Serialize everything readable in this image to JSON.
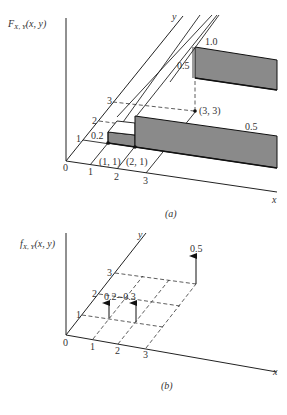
{
  "figure_a": {
    "caption": "(a)",
    "z_label": "F",
    "z_label_sub": "X, Y",
    "z_label_args": "(x, y)",
    "x_axis_label": "x",
    "y_axis_label": "y",
    "origin_label": "0",
    "x_ticks": [
      "1",
      "2",
      "3"
    ],
    "y_ticks": [
      "1",
      "2",
      "3"
    ],
    "points": [
      "(1, 1)",
      "(2, 1)",
      "(3, 3)"
    ],
    "step_labels": {
      "step_1": "0.2",
      "step_2": "0.5",
      "step_3_jump": "0.5",
      "step_3_level": "1.0"
    }
  },
  "figure_b": {
    "caption": "(b)",
    "z_label": "f",
    "z_label_sub": "X, Y",
    "z_label_args": "(x, y)",
    "x_axis_label": "x",
    "y_axis_label": "y",
    "origin_label": "0",
    "x_ticks": [
      "1",
      "2",
      "3"
    ],
    "y_ticks": [
      "1",
      "2",
      "3"
    ],
    "impulses": [
      {
        "x": 1,
        "y": 1,
        "weight": "0.2"
      },
      {
        "x": 2,
        "y": 1,
        "weight": "0.3"
      },
      {
        "x": 3,
        "y": 3,
        "weight": "0.5"
      }
    ],
    "impulse_label_left": "0.2",
    "impulse_label_sep": "--",
    "impulse_label_mid": "0.3",
    "impulse_label_right": "0.5"
  }
}
